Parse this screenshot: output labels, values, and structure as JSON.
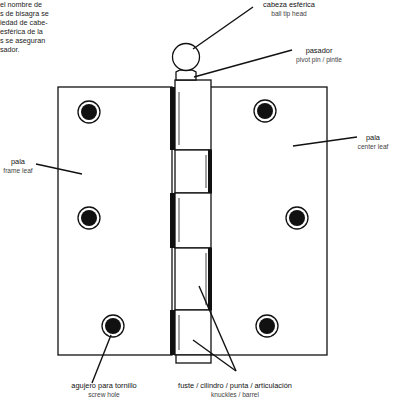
{
  "intro_text": {
    "lines": [
      "el nombre de",
      "s de bisagra se",
      "iedad de cabe-",
      " esférica de la",
      "s se aseguran",
      "sador."
    ]
  },
  "labels": {
    "ball_tip": {
      "es": "cabeza esférica",
      "en": "ball tip head"
    },
    "pivot_pin": {
      "es": "pasador",
      "en": "pivot pin / pintle"
    },
    "frame_leaf": {
      "es": "pala",
      "en": "frame leaf"
    },
    "center_leaf": {
      "es": "pala",
      "en": "center leaf"
    },
    "screw_hole": {
      "es": "agujero para tornillo",
      "en": "screw hole"
    },
    "knuckles": {
      "es": "fuste / cilindro / punta / articulación",
      "en": "knuckles / barrel"
    }
  },
  "colors": {
    "line": "#111111",
    "background": "#ffffff"
  }
}
